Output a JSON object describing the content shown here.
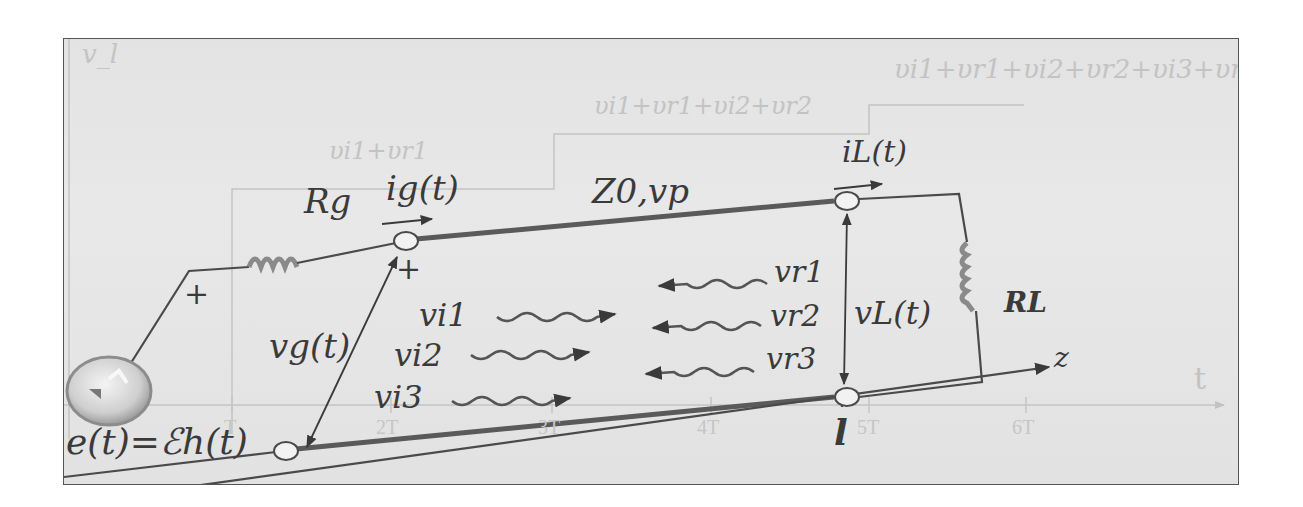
{
  "diagram": {
    "background_chart": {
      "y_axis_label": "v_l",
      "x_axis_label": "t",
      "ticks": [
        "T",
        "2T",
        "3T",
        "4T",
        "5T",
        "6T"
      ],
      "step_labels": [
        "υi1+υr1",
        "υi1+υr1+υi2+υr2",
        "υi1+υr1+υi2+υr2+υi3+υr3"
      ]
    },
    "circuit": {
      "source_label": "e(t)=ℰh(t)",
      "source_polarity": "+",
      "generator_resistor": "Rg",
      "generator_current": "ig(t)",
      "generator_voltage": "vg(t)",
      "line_params": "Z0,vp",
      "load_current": "iL(t)",
      "load_voltage": "vL(t)",
      "load_resistor": "RL",
      "axis_z": "z",
      "line_length": "l",
      "plus_sign": "+"
    },
    "waves": {
      "incident": [
        "vi1",
        "vi2",
        "vi3"
      ],
      "reflected": [
        "vr1",
        "vr2",
        "vr3"
      ]
    },
    "colors": {
      "ink": "#3a3a3a",
      "faint_chart": "#c4c4c4",
      "background": "#e5e5e5",
      "frame": "#555555"
    }
  }
}
